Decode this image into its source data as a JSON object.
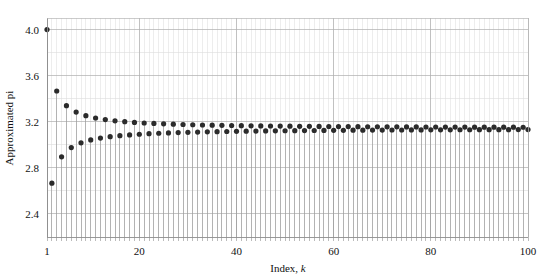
{
  "figure": {
    "title": "",
    "background_color": "#ffffff",
    "plot_area": {
      "left": 47,
      "top": 18,
      "right": 528,
      "bottom": 237
    }
  },
  "axes": {
    "y_title": "Approximated pi",
    "x_title_prefix": "Index, ",
    "x_title_symbol": "k",
    "y_major_ticks": [
      "2.4",
      "2.8",
      "3.2",
      "3.6",
      "4.0"
    ],
    "x_major_ticks": [
      "1",
      "20",
      "40",
      "60",
      "80",
      "100"
    ]
  },
  "style": {
    "marker_color": "#2b2b2b",
    "stem_color": "#9a9a9a",
    "grid_major_color": "#aeaeae",
    "grid_minor_color": "#dcdcdc",
    "frame_color": "#b5b5b5",
    "marker_size": 2.6,
    "stem_width": 0.7
  },
  "chart_data": {
    "type": "line",
    "plot_style": "stem",
    "title": "",
    "xlabel": "Index, k",
    "ylabel": "Approximated pi",
    "xlim": [
      1,
      100
    ],
    "ylim": [
      2.2,
      4.1
    ],
    "grid": true,
    "legend": "none",
    "y_major_tick_values": [
      2.4,
      2.8,
      3.2,
      3.6,
      4.0
    ],
    "y_minor_tick_values": [
      2.2,
      2.6,
      3.0,
      3.4,
      3.8
    ],
    "x_major_tick_values": [
      1,
      20,
      40,
      60,
      80,
      100
    ],
    "x_minor_tick_step": 1,
    "series_name": "Leibniz approximation of pi",
    "x": [
      1,
      2,
      3,
      4,
      5,
      6,
      7,
      8,
      9,
      10,
      11,
      12,
      13,
      14,
      15,
      16,
      17,
      18,
      19,
      20,
      21,
      22,
      23,
      24,
      25,
      26,
      27,
      28,
      29,
      30,
      31,
      32,
      33,
      34,
      35,
      36,
      37,
      38,
      39,
      40,
      41,
      42,
      43,
      44,
      45,
      46,
      47,
      48,
      49,
      50,
      51,
      52,
      53,
      54,
      55,
      56,
      57,
      58,
      59,
      60,
      61,
      62,
      63,
      64,
      65,
      66,
      67,
      68,
      69,
      70,
      71,
      72,
      73,
      74,
      75,
      76,
      77,
      78,
      79,
      80,
      81,
      82,
      83,
      84,
      85,
      86,
      87,
      88,
      89,
      90,
      91,
      92,
      93,
      94,
      95,
      96,
      97,
      98,
      99,
      100
    ],
    "values": [
      4.0,
      2.6667,
      3.4667,
      2.8952,
      3.3397,
      2.976,
      3.2837,
      3.0171,
      3.2524,
      3.0418,
      3.2323,
      3.0584,
      3.2184,
      3.0702,
      3.2081,
      3.0791,
      3.2003,
      3.086,
      3.1941,
      3.0916,
      3.1891,
      3.0962,
      3.185,
      3.1,
      3.1815,
      3.1032,
      3.1786,
      3.106,
      3.176,
      3.1084,
      3.1738,
      3.1105,
      3.1718,
      3.1124,
      3.1701,
      3.114,
      3.1685,
      3.1155,
      3.1672,
      3.1168,
      3.1659,
      3.1181,
      3.1648,
      3.1192,
      3.1638,
      3.1202,
      3.1628,
      3.1211,
      3.162,
      3.122,
      3.1612,
      3.1228,
      3.1605,
      3.1235,
      3.1598,
      3.1241,
      3.1592,
      3.1248,
      3.1586,
      3.1253,
      3.1581,
      3.1259,
      3.1576,
      3.1264,
      3.1571,
      3.1268,
      3.1567,
      3.1273,
      3.1563,
      3.1277,
      3.1559,
      3.1281,
      3.1555,
      3.1284,
      3.1552,
      3.1288,
      3.1548,
      3.1291,
      3.1545,
      3.1294,
      3.1542,
      3.1297,
      3.154,
      3.13,
      3.1537,
      3.1303,
      3.1534,
      3.1305,
      3.1532,
      3.1308,
      3.153,
      3.131,
      3.1528,
      3.1312,
      3.1526,
      3.1314,
      3.1524,
      3.1316,
      3.1522,
      3.1318
    ]
  }
}
